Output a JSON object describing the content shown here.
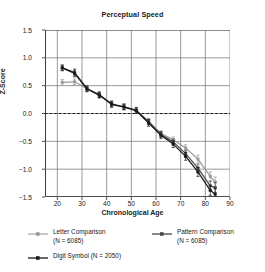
{
  "chart_data": {
    "type": "line",
    "title": "Perceptual Speed",
    "xlabel": "Chronological Age",
    "ylabel": "Z-Score",
    "xlim": [
      15,
      90
    ],
    "ylim": [
      -1.5,
      1.5
    ],
    "grid": true,
    "legend_position": "below",
    "xticks": [
      20,
      30,
      40,
      50,
      60,
      70,
      80,
      90
    ],
    "yticks": [
      1.5,
      1.0,
      0.5,
      0.0,
      -0.5,
      -1.0,
      -1.5
    ],
    "xtick_labels": [
      "20",
      "30",
      "40",
      "50",
      "60",
      "70",
      "80",
      "90"
    ],
    "ytick_labels": [
      "1.5",
      "1.0",
      "0.5",
      "0.0",
      "−0.5",
      "−1.0",
      "−1.5"
    ],
    "reference_line": {
      "y": 0.0,
      "style": "dashed",
      "color": "#1a1a1a"
    },
    "x": [
      22,
      27,
      32,
      37,
      42,
      47,
      52,
      57,
      62,
      67,
      72,
      77,
      82,
      84
    ],
    "series": [
      {
        "name": "Letter Comparison",
        "n": 6085,
        "color": "#9b9b9b",
        "marker": "square",
        "values": [
          0.56,
          0.57,
          0.45,
          0.33,
          0.18,
          0.11,
          0.05,
          -0.14,
          -0.36,
          -0.47,
          -0.62,
          -0.82,
          -1.13,
          -1.23
        ],
        "errors": [
          0.05,
          0.05,
          0.05,
          0.05,
          0.05,
          0.05,
          0.05,
          0.05,
          0.05,
          0.05,
          0.06,
          0.07,
          0.08,
          0.09
        ]
      },
      {
        "name": "Pattern Comparison",
        "n": 6085,
        "color": "#4a4a4a",
        "marker": "square",
        "values": [
          0.82,
          0.74,
          0.45,
          0.34,
          0.16,
          0.12,
          0.06,
          -0.15,
          -0.38,
          -0.51,
          -0.72,
          -0.98,
          -1.3,
          -1.33
        ],
        "errors": [
          0.05,
          0.06,
          0.05,
          0.05,
          0.05,
          0.05,
          0.05,
          0.05,
          0.05,
          0.05,
          0.06,
          0.07,
          0.08,
          0.09
        ]
      },
      {
        "name": "Digit Symbol",
        "n": 2050,
        "color": "#1a1a1a",
        "marker": "square",
        "values": [
          0.82,
          0.72,
          0.44,
          0.33,
          0.17,
          0.12,
          0.05,
          -0.17,
          -0.39,
          -0.55,
          -0.77,
          -1.05,
          -1.38,
          -1.45
        ],
        "errors": [
          0.05,
          0.06,
          0.05,
          0.05,
          0.05,
          0.05,
          0.05,
          0.06,
          0.06,
          0.06,
          0.07,
          0.08,
          0.09,
          0.1
        ]
      }
    ]
  },
  "legend": {
    "letter": {
      "label": "Letter Comparison",
      "sublabel": "(N = 6085)"
    },
    "pattern": {
      "label": "Pattern Comparison",
      "sublabel": "(N = 6085)"
    },
    "digit": {
      "label": "Digit Symbol (N = 2050)",
      "sublabel": ""
    }
  }
}
